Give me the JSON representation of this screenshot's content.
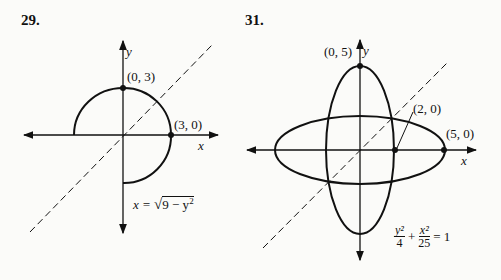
{
  "figures": [
    {
      "number": "29.",
      "axis_x": "x",
      "axis_y": "y",
      "points": [
        {
          "label": "(0, 3)",
          "x": 0,
          "y": 3
        },
        {
          "label": "(3, 0)",
          "x": 3,
          "y": 0
        }
      ],
      "equation": "x = √(9 − y²)",
      "eq_lhs": "x = ",
      "eq_rad": "9 − y",
      "eq_exp": "2"
    },
    {
      "number": "31.",
      "axis_x": "x",
      "axis_y": "y",
      "points": [
        {
          "label": "(0, 5)",
          "x": 0,
          "y": 5
        },
        {
          "label": "(2, 0)",
          "x": 2,
          "y": 0
        },
        {
          "label": "(5, 0)",
          "x": 5,
          "y": 0
        }
      ],
      "equation": "y²/4 + x²/25 = 1",
      "eq_t1_num": "y²",
      "eq_t1_den": "4",
      "eq_plus": "+",
      "eq_t2_num": "x²",
      "eq_t2_den": "25",
      "eq_rhs": "= 1"
    }
  ]
}
